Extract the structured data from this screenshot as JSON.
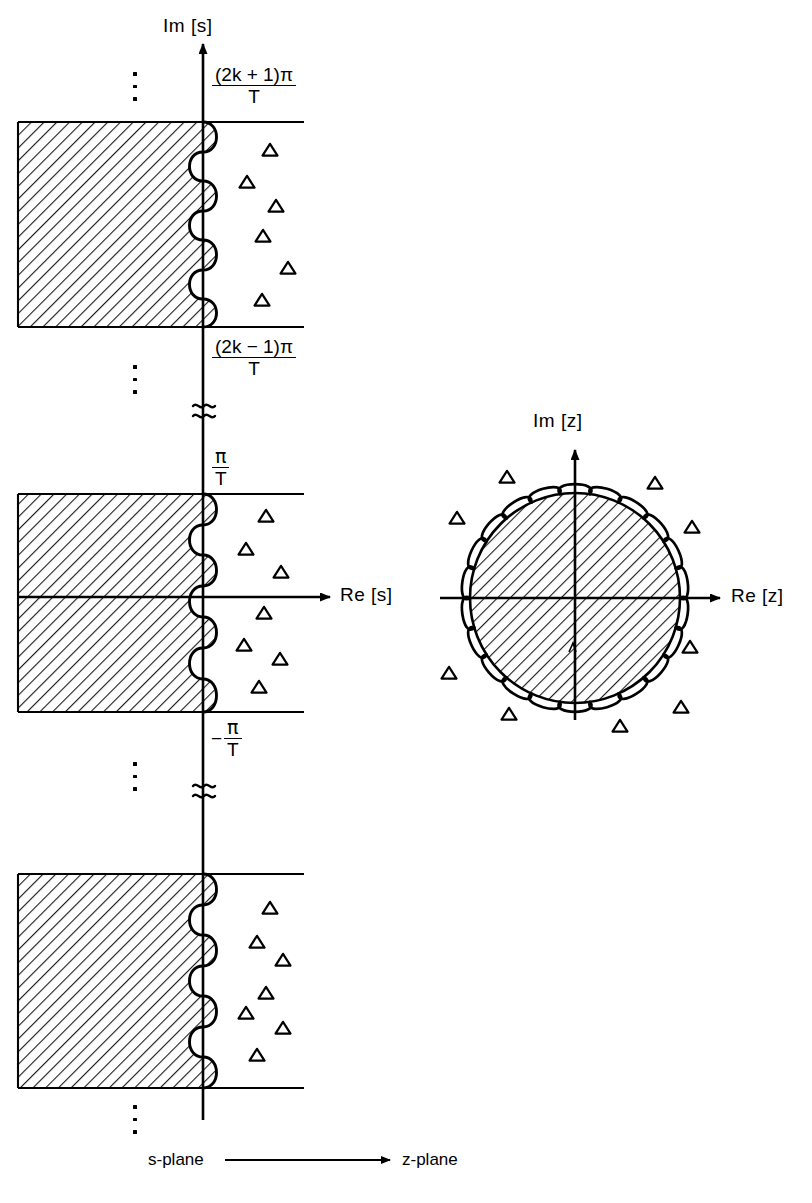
{
  "figure": {
    "width": 812,
    "height": 1203,
    "background": "#ffffff",
    "ink": "#000000"
  },
  "s_plane": {
    "imaginary_axis_label": "Im [s]",
    "real_axis_label": "Re [s]",
    "boundary_labels": [
      {
        "id": "upper-strip-top",
        "numerator": "(2k + 1)π",
        "denominator": "T",
        "sign": ""
      },
      {
        "id": "upper-strip-bottom",
        "numerator": "(2k − 1)π",
        "denominator": "T",
        "sign": ""
      },
      {
        "id": "primary-strip-top",
        "numerator": "π",
        "denominator": "T",
        "sign": ""
      },
      {
        "id": "primary-strip-bottom",
        "numerator": "π",
        "denominator": "T",
        "sign": "−"
      }
    ],
    "ellipses_count": 4,
    "break_marks_count": 2,
    "strips_count": 3,
    "pole_marker": "triangle",
    "hatch_description": "left half-plane shaded"
  },
  "z_plane": {
    "imaginary_axis_label": "Im [z]",
    "real_axis_label": "Re [z]",
    "unit_circle": {
      "center_x": 575,
      "center_y": 598,
      "radius": 105,
      "scallop_count": 22,
      "hatch_description": "unit disk interior shaded"
    },
    "pole_marker": "triangle"
  },
  "caption": {
    "left": "s-plane",
    "right": "z-plane",
    "arrow": "⟶"
  },
  "chart_data": {
    "type": "scatter",
    "xlabel": "Re",
    "ylabel": "Im",
    "panels": [
      {
        "name": "s-plane",
        "axes": {
          "x_label": "Re [s]",
          "y_label": "Im [s]"
        },
        "origin_px": [
          203,
          597
        ],
        "shaded_region": "Re[s] < 0 (left half-plane), shown as three periodic strips",
        "strips": [
          {
            "id": "strip-upper",
            "y_top_px": 122,
            "y_bottom_px": 327,
            "top_boundary_label": "(2k + 1)π / T",
            "bottom_boundary_label": "(2k − 1)π / T",
            "x_left_px": 18,
            "x_right_line_px": 304,
            "poles_px": [
              [
                270,
                150
              ],
              [
                247,
                182
              ],
              [
                276,
                206
              ],
              [
                263,
                236
              ],
              [
                288,
                268
              ],
              [
                262,
                300
              ]
            ]
          },
          {
            "id": "strip-primary",
            "y_top_px": 494,
            "y_bottom_px": 712,
            "top_boundary_label": "π / T",
            "bottom_boundary_label": "−π / T",
            "x_left_px": 18,
            "x_right_line_px": 304,
            "poles_px": [
              [
                266,
                516
              ],
              [
                246,
                549
              ],
              [
                281,
                572
              ],
              [
                264,
                613
              ],
              [
                244,
                645
              ],
              [
                280,
                659
              ],
              [
                259,
                687
              ]
            ]
          },
          {
            "id": "strip-lower",
            "y_top_px": 874,
            "y_bottom_px": 1088,
            "top_boundary_label": "",
            "bottom_boundary_label": "",
            "x_left_px": 18,
            "x_right_line_px": 304,
            "poles_px": [
              [
                270,
                908
              ],
              [
                257,
                942
              ],
              [
                283,
                960
              ],
              [
                266,
                993
              ],
              [
                246,
                1013
              ],
              [
                283,
                1028
              ],
              [
                257,
                1055
              ]
            ]
          }
        ],
        "ellipses_px": [
          [
            135,
            78
          ],
          [
            135,
            372
          ],
          [
            135,
            768
          ],
          [
            135,
            1112
          ]
        ],
        "break_marks_px": [
          [
            203,
            410
          ],
          [
            203,
            790
          ]
        ]
      },
      {
        "name": "z-plane",
        "axes": {
          "x_label": "Re [z]",
          "y_label": "Im [z]"
        },
        "origin_px": [
          575,
          598
        ],
        "shaded_region": "|z| < 1 (unit disk interior)",
        "unit_circle_radius_px": 105,
        "poles_px": [
          [
            507,
            477
          ],
          [
            655,
            483
          ],
          [
            457,
            518
          ],
          [
            692,
            527
          ],
          [
            449,
            673
          ],
          [
            690,
            647
          ],
          [
            509,
            714
          ],
          [
            620,
            726
          ],
          [
            681,
            707
          ]
        ]
      }
    ],
    "legend": [],
    "grid": false
  }
}
